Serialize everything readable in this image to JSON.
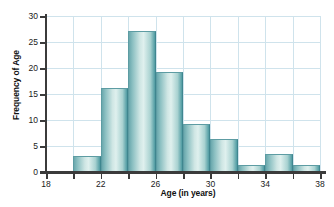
{
  "chart_data": {
    "type": "bar",
    "title": "",
    "subtitle": "",
    "xlabel": "Age (in years)",
    "ylabel": "Frequency of Age",
    "xlim": [
      18,
      38
    ],
    "ylim": [
      0,
      30
    ],
    "bin_width": 2,
    "grid": true,
    "legend": null,
    "annotations": [],
    "xticks": [
      18,
      20,
      22,
      24,
      26,
      28,
      30,
      32,
      34,
      36,
      38
    ],
    "xtick_labels": [
      "18",
      "",
      "22",
      "",
      "26",
      "",
      "30",
      "",
      "34",
      "",
      "38"
    ],
    "yticks": [
      0,
      5,
      10,
      15,
      20,
      25,
      30
    ],
    "ytick_labels": [
      "0",
      "5",
      "10",
      "15",
      "20",
      "25",
      "30"
    ],
    "bins": [
      {
        "start": 18,
        "end": 20,
        "value": 0
      },
      {
        "start": 20,
        "end": 22,
        "value": 3.1
      },
      {
        "start": 22,
        "end": 24,
        "value": 16.1
      },
      {
        "start": 24,
        "end": 26,
        "value": 27.2
      },
      {
        "start": 26,
        "end": 28,
        "value": 19.2
      },
      {
        "start": 28,
        "end": 30,
        "value": 9.3
      },
      {
        "start": 30,
        "end": 32,
        "value": 6.3
      },
      {
        "start": 32,
        "end": 34,
        "value": 1.3
      },
      {
        "start": 34,
        "end": 36,
        "value": 3.4
      },
      {
        "start": 36,
        "end": 38,
        "value": 1.3
      }
    ],
    "categories": [
      "18-20",
      "20-22",
      "22-24",
      "24-26",
      "26-28",
      "28-30",
      "30-32",
      "32-34",
      "34-36",
      "36-38"
    ],
    "values": [
      0,
      3.1,
      16.1,
      27.2,
      19.2,
      9.3,
      6.3,
      1.3,
      3.4,
      1.3
    ],
    "colors": {
      "bar_fill_light": "#dff0ee",
      "bar_fill_dark": "#4f9ba2",
      "bar_edge": "#5d9ca3",
      "grid": "#cfe3ec",
      "axis": "#3b3b3b",
      "text": "#1a1a1a",
      "background": "#ffffff"
    }
  }
}
